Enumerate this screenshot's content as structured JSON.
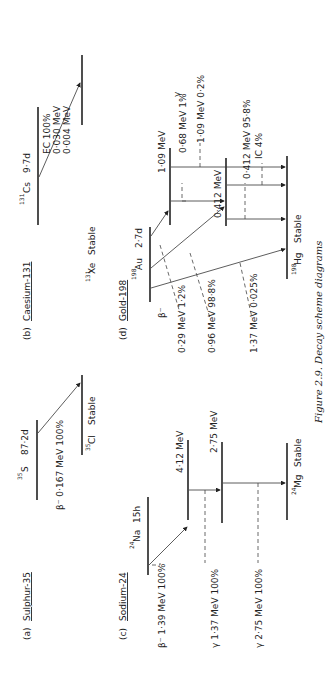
{
  "caption": "Figure 2.9. Decay scheme diagrams",
  "panels": {
    "a": {
      "title_prefix": "(a)",
      "title": "Sulphur-35",
      "parent_mass": "35",
      "parent": "S",
      "parent_halflife": "87·2d",
      "daughter_mass": "35",
      "daughter": "Cl",
      "daughter_state": "Stable",
      "beta_label": "β⁻ 0·167 MeV 100%"
    },
    "b": {
      "title_prefix": "(b)",
      "title": "Caesium-131",
      "parent_mass": "131",
      "parent": "Cs",
      "parent_halflife": "9·7d",
      "daughter_mass": "131",
      "daughter": "Xe",
      "daughter_state": "Stable",
      "lines": [
        "EC 100%",
        "0·030 MeV",
        "0·004 MeV"
      ]
    },
    "c": {
      "title_prefix": "(c)",
      "title": "Sodium-24",
      "parent_mass": "24",
      "parent": "Na",
      "parent_halflife": "15h",
      "level1": "4·12 MeV",
      "level2": "2·75 MeV",
      "daughter_mass": "24",
      "daughter": "Mg",
      "daughter_state": "Stable",
      "beta_label": "β⁻ 1·39 MeV 100%",
      "gamma1_label": "γ 1·37 MeV 100%",
      "gamma2_label": "γ 2·75 MeV 100%"
    },
    "d": {
      "title_prefix": "(d)",
      "title": "Gold-198",
      "parent_mass": "198",
      "parent": "Au",
      "parent_halflife": "2·7d",
      "level1": "1·09 MeV",
      "level2": "0·412 MeV",
      "daughter_mass": "198",
      "daughter": "Hg",
      "daughter_state": "Stable",
      "beta_header": "β⁻",
      "beta_lines": [
        "0·29 MeV 1·2%",
        "0·96 MeV 98·8%",
        "1·37 MeV 0·025%"
      ],
      "gamma_header": "γ",
      "gamma_lines": [
        "0·68 MeV 1%",
        "1·09 MeV 0·2%",
        "0·412 MeV 95·8%",
        "IC 4%"
      ]
    }
  }
}
